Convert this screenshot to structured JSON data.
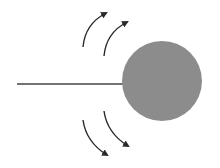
{
  "diagram": {
    "background": "#ffffff",
    "rod": {
      "x1": 17,
      "y1": 84,
      "x2": 124,
      "y2": 84,
      "color": "#454545",
      "width": 1.6
    },
    "ball": {
      "cx": 162,
      "cy": 81,
      "r": 40,
      "fill": "#8c8c8c"
    },
    "arrows": [
      {
        "id": "upper-left",
        "d": "M83,47 Q85,24 106,13",
        "direction": "up"
      },
      {
        "id": "upper-right",
        "d": "M104,56 Q106,33 127,22",
        "direction": "up"
      },
      {
        "id": "lower-left",
        "d": "M83,120 Q86,142 107,155",
        "direction": "down"
      },
      {
        "id": "lower-right",
        "d": "M104,111 Q107,133 128,146",
        "direction": "down"
      }
    ],
    "arrow_color": "#2a2a2a"
  }
}
